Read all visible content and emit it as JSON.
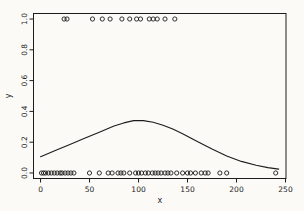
{
  "figure": {
    "background_color": "#fbfaf7",
    "foreground_color": "#1c1c1c"
  },
  "chart_data": {
    "type": "scatter",
    "title": "",
    "xlabel": "x",
    "ylabel": "y",
    "xlim": [
      -7.2,
      250.5
    ],
    "ylim": [
      -0.036,
      1.036
    ],
    "grid": false,
    "x_ticks": [
      {
        "value": 0,
        "label": "0"
      },
      {
        "value": 50,
        "label": "50"
      },
      {
        "value": 100,
        "label": "100"
      },
      {
        "value": 150,
        "label": "150"
      },
      {
        "value": 200,
        "label": "200"
      },
      {
        "value": 250,
        "label": "250"
      }
    ],
    "y_ticks": [
      {
        "value": 0.0,
        "label": "0.0"
      },
      {
        "value": 0.2,
        "label": "0.2"
      },
      {
        "value": 0.4,
        "label": "0.4"
      },
      {
        "value": 0.6,
        "label": "0.6"
      },
      {
        "value": 0.8,
        "label": "0.8"
      },
      {
        "value": 1.0,
        "label": "1.0"
      }
    ],
    "series": [
      {
        "name": "observations-y1",
        "marker": "open-circle",
        "y_constant": 1,
        "x": [
          24,
          27,
          53,
          63,
          71,
          83,
          91,
          98,
          102,
          111,
          115,
          119,
          127,
          137
        ]
      },
      {
        "name": "observations-y0",
        "marker": "open-circle",
        "y_constant": 0,
        "x": [
          1,
          3,
          5,
          8,
          11,
          14,
          17,
          20,
          22,
          25,
          28,
          31,
          34,
          50,
          60,
          69,
          73,
          79,
          82,
          85,
          91,
          97,
          100,
          103,
          107,
          110,
          114,
          117,
          120,
          123,
          127,
          130,
          133,
          139,
          145,
          150,
          153,
          158,
          164,
          168,
          171,
          183,
          190,
          240
        ]
      }
    ],
    "curve": {
      "name": "smooth-fit",
      "points": [
        [
          0,
          0.105
        ],
        [
          15,
          0.145
        ],
        [
          30,
          0.185
        ],
        [
          45,
          0.225
        ],
        [
          60,
          0.265
        ],
        [
          75,
          0.305
        ],
        [
          85,
          0.325
        ],
        [
          95,
          0.34
        ],
        [
          105,
          0.34
        ],
        [
          115,
          0.33
        ],
        [
          125,
          0.31
        ],
        [
          135,
          0.285
        ],
        [
          145,
          0.255
        ],
        [
          160,
          0.205
        ],
        [
          175,
          0.155
        ],
        [
          190,
          0.11
        ],
        [
          205,
          0.075
        ],
        [
          220,
          0.05
        ],
        [
          232,
          0.035
        ],
        [
          243,
          0.025
        ]
      ]
    }
  }
}
